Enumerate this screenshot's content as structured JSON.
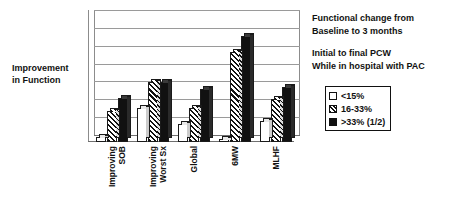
{
  "chart_data": {
    "type": "bar",
    "title": "",
    "xlabel": "",
    "ylabel": "Improvement in Function",
    "ylabel_lines": [
      "Improvement",
      "in Function"
    ],
    "categories": [
      "Improving SOB",
      "Improving Worst Sx",
      "Global",
      "6MW",
      "MLHF"
    ],
    "category_lines": [
      [
        "Improving",
        "SOB"
      ],
      [
        "Improving",
        "Worst Sx"
      ],
      [
        "Global"
      ],
      [
        "6MW"
      ],
      [
        "MLHF"
      ]
    ],
    "series": [
      {
        "name": "<15%",
        "values": [
          4,
          27,
          14,
          2,
          17
        ]
      },
      {
        "name": "16-33%",
        "values": [
          25,
          48,
          27,
          72,
          34
        ]
      },
      {
        "name": ">33% (1/2)",
        "values": [
          35,
          48,
          42,
          85,
          44
        ]
      }
    ],
    "ylim": [
      0,
      100
    ],
    "grid": true,
    "gridlines": 7,
    "y_ticks_visible": false,
    "legend_position": "right",
    "annotations": [
      "Functional change from Baseline to 3 months",
      "Initial to final PCW While in hospital with PAC"
    ]
  },
  "notes": {
    "block1": {
      "line1": "Functional change from",
      "line2": "Baseline to 3 months"
    },
    "block2": {
      "line1": "Initial to final PCW",
      "line2": "While in hospital with PAC"
    }
  },
  "legend": {
    "items": [
      {
        "label": "<15%",
        "swatch": "white-square-icon"
      },
      {
        "label": "16-33%",
        "swatch": "hatched-square-icon"
      },
      {
        "label": ">33% (1/2)",
        "swatch": "black-square-icon"
      }
    ]
  },
  "axis": {
    "y_title_line1": "Improvement",
    "y_title_line2": "in Function"
  }
}
